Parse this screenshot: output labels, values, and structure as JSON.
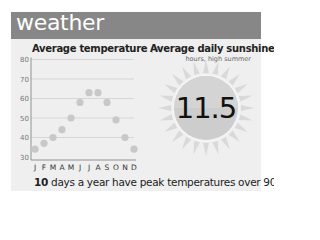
{
  "header": {
    "title": "weather"
  },
  "temperature_chart": {
    "title": "Average temperature",
    "unit": "(°F)"
  },
  "sunshine": {
    "title": "Average daily sunshine",
    "subtitle": "hours, high summer",
    "value": "11.5"
  },
  "footer": {
    "bold": "10",
    "text": " days a year have peak temperatures over 90°F"
  },
  "colors": {
    "header_bg": "#878787",
    "panel_bg": "#efefef",
    "dot": "#c8c8c8",
    "grid": "#cfcfcf",
    "sun_body": "#cdcdcd",
    "sun_rays": "#d9d9d9"
  },
  "chart_data": [
    {
      "type": "scatter",
      "title": "Average temperature (°F)",
      "xlabel": "",
      "ylabel": "",
      "categories": [
        "J",
        "F",
        "M",
        "A",
        "M",
        "J",
        "J",
        "A",
        "S",
        "O",
        "N",
        "D"
      ],
      "values": [
        34,
        37,
        40,
        44,
        50,
        58,
        63,
        63,
        58,
        49,
        40,
        34
      ],
      "ylim": [
        30,
        80
      ],
      "yticks": [
        30,
        40,
        50,
        60,
        70,
        80
      ],
      "grid": true,
      "legend": null
    },
    {
      "type": "table",
      "title": "Average daily sunshine",
      "subtitle": "hours, high summer",
      "values": [
        11.5
      ]
    }
  ]
}
